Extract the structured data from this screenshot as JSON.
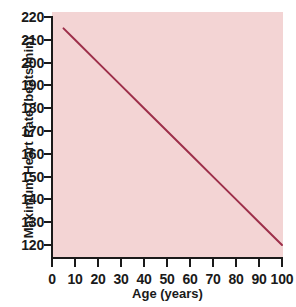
{
  "chart_data": {
    "type": "line",
    "title": "",
    "xlabel": "Age (years)",
    "ylabel": "Maximum Heart Rate (beats/min)",
    "xlim": [
      0,
      100
    ],
    "ylim": [
      115,
      220
    ],
    "xticks": [
      0,
      10,
      20,
      30,
      40,
      50,
      60,
      70,
      80,
      90,
      100
    ],
    "yticks": [
      120,
      130,
      140,
      150,
      160,
      170,
      180,
      190,
      200,
      210,
      220
    ],
    "xtick_labels": [
      "0",
      "10",
      "20",
      "30",
      "40",
      "50",
      "60",
      "70",
      "80",
      "90",
      "100"
    ],
    "ytick_labels": [
      "120",
      "130",
      "140",
      "150",
      "160",
      "170",
      "180",
      "190",
      "200",
      "210",
      "220"
    ],
    "grid": false,
    "legend": false,
    "relation": "Maximum Heart Rate = 220 - Age",
    "series": [
      {
        "name": "Maximum Heart Rate",
        "color": "#9d2f4a",
        "line_width": 2,
        "x": [
          5,
          10,
          20,
          30,
          40,
          50,
          60,
          70,
          80,
          90,
          100
        ],
        "y": [
          215,
          210,
          200,
          190,
          180,
          170,
          160,
          150,
          140,
          130,
          120
        ],
        "endpoints": {
          "start": {
            "x": 5,
            "y": 215
          },
          "end": {
            "x": 100,
            "y": 120
          }
        }
      }
    ],
    "colors": {
      "plot_background": "#f3d4d4",
      "figure_background": "#ffffff",
      "axis": "#1a1a1a",
      "text": "#1a1a1a",
      "line": "#9d2f4a"
    }
  }
}
